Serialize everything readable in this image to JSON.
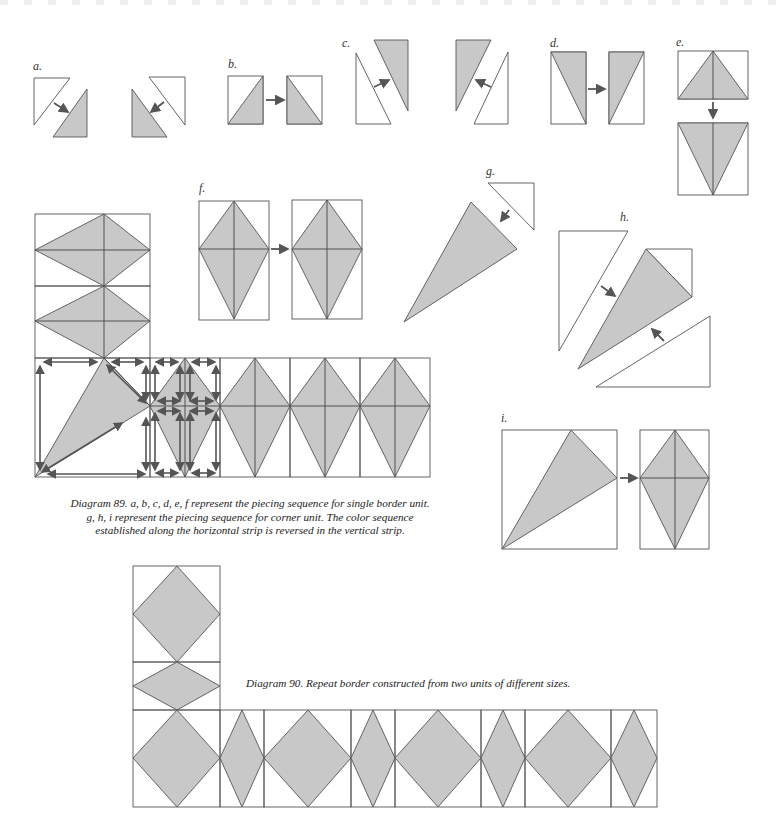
{
  "labels": {
    "a": "a.",
    "b": "b.",
    "c": "c.",
    "d": "d.",
    "e": "e.",
    "f": "f.",
    "g": "g.",
    "h": "h.",
    "i": "i."
  },
  "captions": {
    "diagram89": {
      "line1": "Diagram 89. a, b, c, d, e, f represent the piecing sequence for single border unit.",
      "line2": "g, h, i represent the piecing sequence for corner unit. The color sequence",
      "line3": "established along the horizontal strip is reversed in the vertical strip."
    },
    "diagram90": "Diagram 90. Repeat border constructed from two units of different sizes."
  },
  "colors": {
    "fabric_fill": "#c8c8c8",
    "outline": "#555555",
    "background": "#ffffff"
  }
}
